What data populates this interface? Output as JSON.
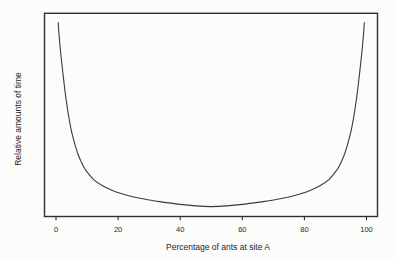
{
  "figure": {
    "background_color": "#fcfcfb",
    "curve_color": "#3a3a3a",
    "box_color": "#2f2f2f",
    "text_color": "#1f1f1f"
  },
  "chart_data": {
    "type": "line",
    "title": "",
    "xlabel": "Percentage of ants at site A",
    "ylabel": "Relative amounts of time",
    "x_ticks": [
      0,
      20,
      40,
      60,
      80,
      100
    ],
    "y_ticks": [],
    "xlim": [
      -3.7,
      103.5
    ],
    "ylim": [
      -0.05,
      1.05
    ],
    "grid": false,
    "legend": null,
    "series": [
      {
        "name": "relative-time-curve",
        "points": [
          [
            0.7,
            1.0
          ],
          [
            1.0,
            0.93
          ],
          [
            1.4,
            0.855
          ],
          [
            1.8,
            0.79
          ],
          [
            2.2,
            0.73
          ],
          [
            2.7,
            0.655
          ],
          [
            3.2,
            0.59
          ],
          [
            4,
            0.5
          ],
          [
            5,
            0.41
          ],
          [
            6,
            0.345
          ],
          [
            7,
            0.29
          ],
          [
            8,
            0.25
          ],
          [
            9,
            0.215
          ],
          [
            10,
            0.19
          ],
          [
            12,
            0.15
          ],
          [
            15,
            0.115
          ],
          [
            18,
            0.091
          ],
          [
            21,
            0.073
          ],
          [
            25,
            0.054
          ],
          [
            30,
            0.038
          ],
          [
            35,
            0.025
          ],
          [
            40,
            0.014
          ],
          [
            45,
            0.006
          ],
          [
            50,
            0.002
          ],
          [
            55,
            0.006
          ],
          [
            60,
            0.014
          ],
          [
            65,
            0.025
          ],
          [
            70,
            0.038
          ],
          [
            75,
            0.054
          ],
          [
            79,
            0.073
          ],
          [
            82,
            0.091
          ],
          [
            85,
            0.115
          ],
          [
            88,
            0.15
          ],
          [
            90,
            0.19
          ],
          [
            91,
            0.215
          ],
          [
            92,
            0.25
          ],
          [
            93,
            0.29
          ],
          [
            94,
            0.345
          ],
          [
            95,
            0.41
          ],
          [
            96,
            0.5
          ],
          [
            96.8,
            0.59
          ],
          [
            97.3,
            0.655
          ],
          [
            97.8,
            0.73
          ],
          [
            98.2,
            0.79
          ],
          [
            98.6,
            0.855
          ],
          [
            99.0,
            0.93
          ],
          [
            99.3,
            1.0
          ]
        ]
      }
    ]
  }
}
